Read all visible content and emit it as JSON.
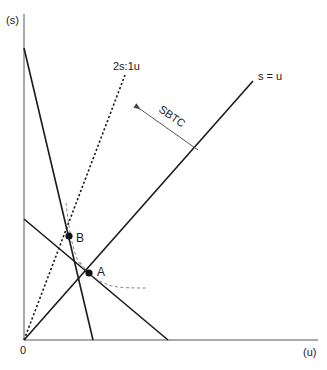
{
  "axes": {
    "y_label": "(s)",
    "x_label": "(u)",
    "origin_label": "0"
  },
  "lines": {
    "equal_ratio_label": "s = u",
    "skill_ratio_label": "2s:1u",
    "shift_label": "SBTC"
  },
  "points": {
    "a_label": "A",
    "b_label": "B"
  },
  "colors": {
    "line": "#1a1a1a",
    "axis": "#555555",
    "indifference": "#777777"
  }
}
